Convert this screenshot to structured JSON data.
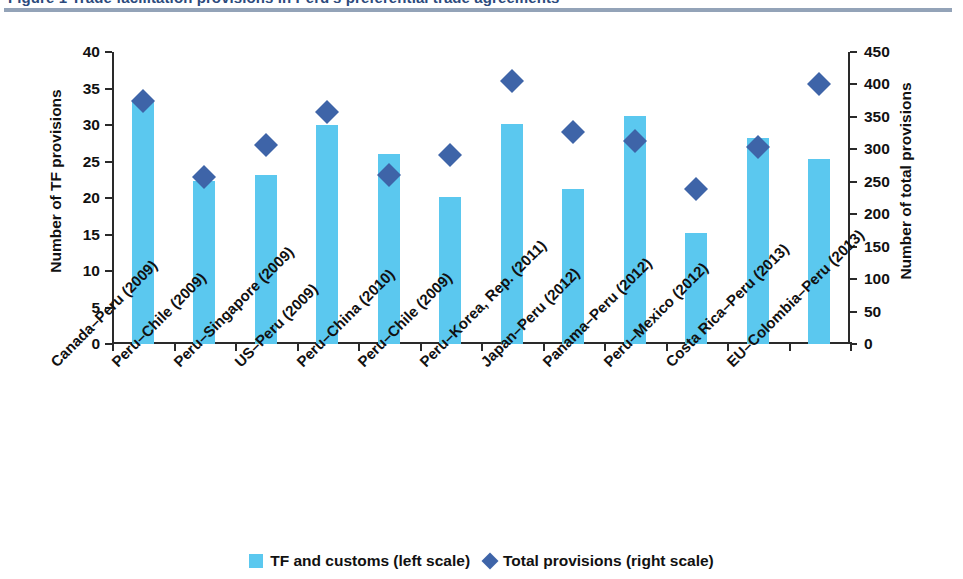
{
  "figure": {
    "title": "Figure 1  Trade facilitation provisions in Peru's preferential trade agreements",
    "title_rule_color": "#93a3b8"
  },
  "axes": {
    "left": {
      "title": "Number of TF provisions",
      "ticks": [
        "40",
        "35",
        "30",
        "25",
        "20",
        "15",
        "10",
        "5",
        "0"
      ],
      "min": 0,
      "max": 40,
      "step": 5
    },
    "right": {
      "title": "Number of total provisions",
      "ticks": [
        "450",
        "400",
        "350",
        "300",
        "250",
        "200",
        "150",
        "100",
        "50",
        "0"
      ],
      "min": 0,
      "max": 450,
      "step": 50
    }
  },
  "legend": {
    "bar_label": "TF and customs (left scale)",
    "marker_label": "Total provisions (right scale)",
    "bar_color": "#5bc8ef",
    "marker_color": "#3e64a8"
  },
  "chart_data": {
    "type": "bar",
    "title": "Trade facilitation provisions in Peru's preferential trade agreements",
    "xlabel": "",
    "ylabel": "Number of TF provisions",
    "y2label": "Number of total provisions",
    "ylim": [
      0,
      40
    ],
    "y2lim": [
      0,
      450
    ],
    "grid": false,
    "legend_position": "bottom-center",
    "categories": [
      "Canada–Peru (2009)",
      "Peru–Chile (2009)",
      "Peru–Singapore (2009)",
      "US–Peru (2009)",
      "Peru–China (2010)",
      "Peru–Chile (2009)",
      "Peru–Korea, Rep. (2011)",
      "Japan–Peru (2012)",
      "Panama–Peru (2012)",
      "Peru–Mexico (2012)",
      "Costa Rica–Peru (2013)",
      "EU–Colombia–Peru (2013)"
    ],
    "series": [
      {
        "name": "TF and customs (left scale)",
        "type": "bar",
        "axis": "left",
        "color": "#5bc8ef",
        "values": [
          33.3,
          22.3,
          23.2,
          30.0,
          26.0,
          20.1,
          30.2,
          21.2,
          31.2,
          15.2,
          28.2,
          25.3
        ]
      },
      {
        "name": "Total provisions (right scale)",
        "type": "scatter",
        "axis": "right",
        "color": "#3e64a8",
        "marker": "diamond",
        "values": [
          375,
          258,
          306,
          357,
          260,
          292,
          405,
          326,
          313,
          239,
          304,
          401
        ]
      }
    ]
  }
}
